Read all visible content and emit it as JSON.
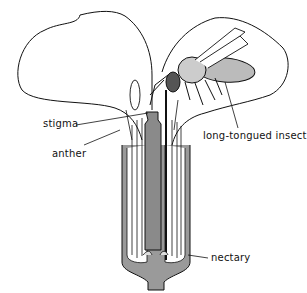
{
  "figure": {
    "labels": {
      "stigma": "stigma",
      "anther": "anther",
      "insect": "long-tongued insect",
      "nectary": "nectary"
    }
  }
}
